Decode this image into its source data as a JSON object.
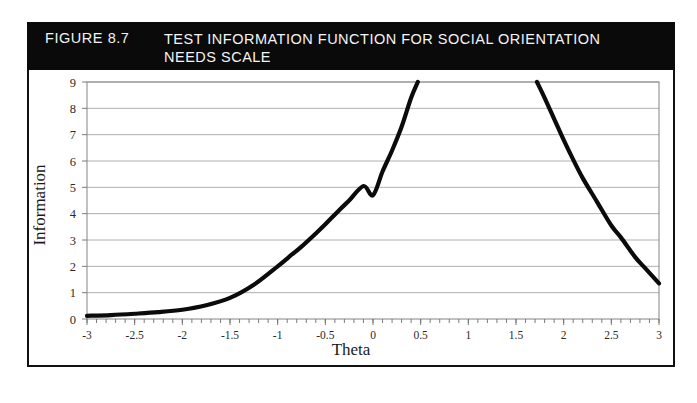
{
  "figure": {
    "number_label": "FIGURE 8.7",
    "title": "TEST INFORMATION FUNCTION FOR SOCIAL ORIENTATION NEEDS SCALE",
    "header_bg": "#0a0a0a",
    "header_fg": "#ffffff",
    "border_color": "#111111"
  },
  "chart_data": {
    "type": "line",
    "title": "TEST INFORMATION FUNCTION FOR SOCIAL ORIENTATION NEEDS SCALE",
    "xlabel": "Theta",
    "ylabel": "Information",
    "xlim": [
      -3,
      3
    ],
    "ylim": [
      0,
      9
    ],
    "grid": true,
    "legend": null,
    "curve_color": "#0b0b0b",
    "xticks": [
      -3,
      -2.5,
      -2,
      -1.5,
      -1,
      -0.5,
      0,
      0.5,
      1,
      1.5,
      2,
      2.5,
      3
    ],
    "xtick_labels": [
      "-3",
      "-2.5",
      "-2",
      "-1.5",
      "-1",
      "-0.5",
      "0",
      "0.5",
      "1",
      "1.5",
      "2",
      "2.5",
      "3"
    ],
    "yticks": [
      0,
      1,
      2,
      3,
      4,
      5,
      6,
      7,
      8,
      9
    ],
    "ytick_labels": [
      "0",
      "1",
      "2",
      "3",
      "4",
      "5",
      "6",
      "7",
      "8",
      "9"
    ],
    "minor_xticks_per_interval": 5,
    "note": "Curve is clipped at the top of the plot (Information = 9); it rises off-scale between theta 0.47 and 1.72.",
    "series": [
      {
        "name": "Test information function (ascending branch)",
        "clipped_top": true,
        "x": [
          -3.0,
          -2.75,
          -2.5,
          -2.25,
          -2.0,
          -1.75,
          -1.5,
          -1.25,
          -1.0,
          -0.85,
          -0.75,
          -0.6,
          -0.5,
          -0.35,
          -0.25,
          -0.1,
          0.0,
          0.1,
          0.2,
          0.3,
          0.4,
          0.47
        ],
        "y": [
          0.12,
          0.15,
          0.2,
          0.26,
          0.35,
          0.52,
          0.8,
          1.3,
          2.0,
          2.45,
          2.75,
          3.25,
          3.6,
          4.15,
          4.5,
          5.05,
          4.7,
          5.6,
          6.4,
          7.3,
          8.4,
          9.0
        ]
      },
      {
        "name": "Test information function (descending branch)",
        "clipped_top": true,
        "x": [
          1.72,
          1.8,
          1.9,
          2.0,
          2.1,
          2.2,
          2.35,
          2.5,
          2.6,
          2.75,
          2.85,
          3.0
        ],
        "y": [
          9.0,
          8.4,
          7.6,
          6.8,
          6.05,
          5.35,
          4.45,
          3.55,
          3.1,
          2.35,
          1.95,
          1.35
        ]
      }
    ]
  }
}
